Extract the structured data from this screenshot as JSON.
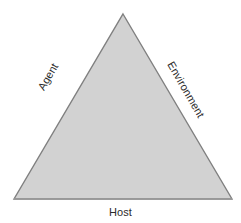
{
  "diagram": {
    "type": "triangle-model",
    "background_color": "#ffffff",
    "shape": {
      "name": "triangle",
      "fill_color": "#d2d2d2",
      "stroke_color": "#808080",
      "base_stroke_color": "#9a9a9a",
      "stroke_width": 1.4,
      "vertices": {
        "apex": [
          123,
          14
        ],
        "bottom_left": [
          14,
          199
        ],
        "bottom_right": [
          232,
          199
        ]
      }
    },
    "labels": {
      "left_edge": "Agent",
      "right_edge": "Environment",
      "bottom_edge": "Host"
    },
    "label_color": "#2b2b2b",
    "label_font_size": "11px",
    "label_rotations": {
      "left_edge": -60,
      "right_edge": 60,
      "bottom_edge": 0
    }
  },
  "chart_data": {
    "type": "diagram",
    "title": "",
    "categories": [
      "Agent",
      "Environment",
      "Host"
    ]
  }
}
